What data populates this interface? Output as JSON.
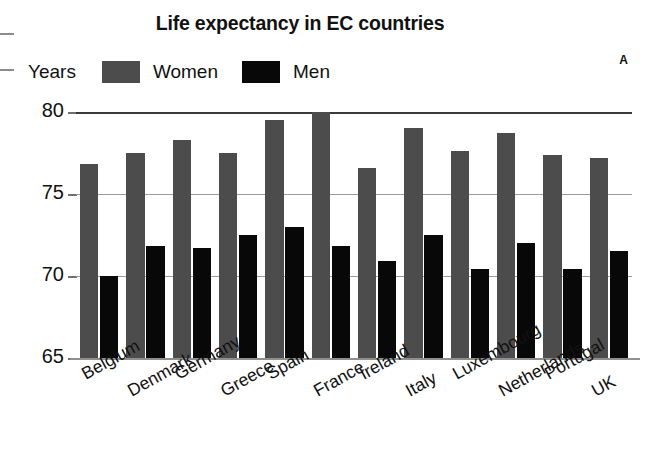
{
  "chart_data": {
    "type": "bar",
    "title": "Life expectancy in EC countries",
    "panel_letter": "A",
    "xlabel": "",
    "ylabel": "Years",
    "ylim": [
      65,
      80
    ],
    "yticks": [
      65,
      70,
      75,
      80
    ],
    "grid": true,
    "legend_position": "top-left",
    "categories": [
      "Belgium",
      "Denmark",
      "Germany",
      "Greece",
      "Spain",
      "France",
      "Ireland",
      "Italy",
      "Luxembourg",
      "Netherlands",
      "Portugal",
      "UK"
    ],
    "series": [
      {
        "name": "Women",
        "color": "#4c4c4c",
        "values": [
          76.8,
          77.5,
          78.3,
          77.5,
          79.5,
          80.0,
          76.6,
          79.0,
          77.6,
          78.7,
          77.4,
          77.2
        ]
      },
      {
        "name": "Men",
        "color": "#080808",
        "values": [
          70.0,
          71.8,
          71.7,
          72.5,
          73.0,
          71.8,
          70.9,
          72.5,
          70.4,
          72.0,
          70.4,
          71.5
        ]
      }
    ]
  },
  "axis": {
    "unit_label": "Years",
    "tick_labels": [
      "80",
      "75",
      "70",
      "65"
    ]
  }
}
